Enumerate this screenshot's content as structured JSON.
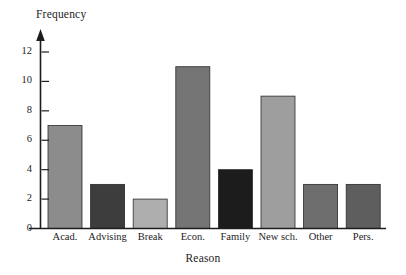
{
  "chart_data": {
    "type": "bar",
    "title": "",
    "xlabel": "Reason",
    "ylabel": "Frequency",
    "categories": [
      "Acad.",
      "Advising",
      "Break",
      "Econ.",
      "Family",
      "New sch.",
      "Other",
      "Pers."
    ],
    "values": [
      7,
      3,
      2,
      11,
      4,
      9,
      3,
      3
    ],
    "bar_colors": [
      "#8c8c8c",
      "#3d3d3d",
      "#aeaeae",
      "#757575",
      "#1c1c1c",
      "#9e9e9e",
      "#6e6e6e",
      "#5e5e5e"
    ],
    "ylim": [
      0,
      13
    ],
    "yticks": [
      0,
      2,
      4,
      6,
      8,
      10,
      12
    ],
    "ytick_labels": [
      "0",
      "2",
      "4",
      "6",
      "8",
      "10",
      "12"
    ],
    "grid": false,
    "legend": false,
    "legend_position": "none",
    "axis_color": "#1c1c1c",
    "background": "#ffffff"
  }
}
